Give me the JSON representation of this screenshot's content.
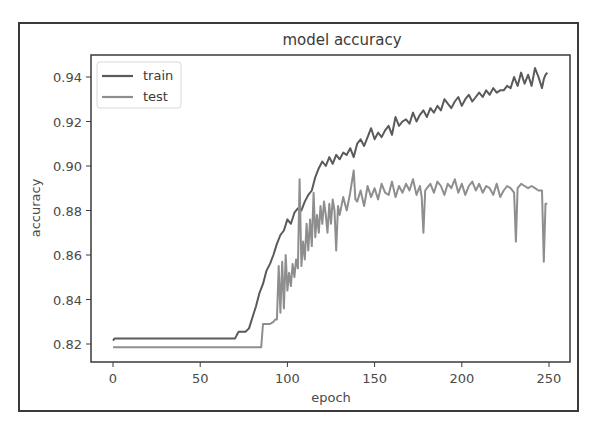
{
  "chart_data": {
    "type": "line",
    "title": "model accuracy",
    "xlabel": "epoch",
    "ylabel": "accuracy",
    "xlim": [
      -12,
      262
    ],
    "ylim": [
      0.8125,
      0.9485
    ],
    "xticks": [
      0,
      50,
      100,
      150,
      200,
      250
    ],
    "yticks": [
      0.82,
      0.84,
      0.86,
      0.88,
      0.9,
      0.92,
      0.94
    ],
    "ytick_labels": [
      "0.82",
      "0.84",
      "0.86",
      "0.88",
      "0.90",
      "0.92",
      "0.94"
    ],
    "grid": false,
    "legend": {
      "position": "upper left",
      "entries": [
        "train",
        "test"
      ]
    },
    "series": [
      {
        "name": "train",
        "color": "#5a5a5a",
        "x": [
          0,
          1,
          10,
          30,
          50,
          70,
          71,
          72,
          74,
          76,
          78,
          80,
          82,
          84,
          86,
          88,
          90,
          92,
          94,
          96,
          98,
          100,
          102,
          104,
          106,
          108,
          110,
          112,
          114,
          116,
          118,
          120,
          122,
          124,
          126,
          128,
          130,
          132,
          134,
          136,
          138,
          140,
          142,
          144,
          146,
          148,
          150,
          152,
          154,
          156,
          158,
          160,
          162,
          164,
          166,
          168,
          170,
          172,
          174,
          176,
          178,
          180,
          182,
          184,
          186,
          188,
          190,
          192,
          194,
          196,
          198,
          200,
          202,
          204,
          206,
          208,
          210,
          212,
          214,
          216,
          218,
          220,
          222,
          224,
          226,
          228,
          230,
          232,
          234,
          236,
          238,
          240,
          242,
          244,
          246,
          247,
          248,
          249
        ],
        "y": [
          0.8215,
          0.8225,
          0.8225,
          0.8225,
          0.8225,
          0.8225,
          0.824,
          0.8255,
          0.8255,
          0.8255,
          0.827,
          0.832,
          0.837,
          0.843,
          0.847,
          0.853,
          0.856,
          0.86,
          0.865,
          0.869,
          0.871,
          0.876,
          0.874,
          0.879,
          0.881,
          0.88,
          0.884,
          0.887,
          0.889,
          0.895,
          0.899,
          0.902,
          0.9,
          0.904,
          0.901,
          0.905,
          0.903,
          0.906,
          0.905,
          0.908,
          0.904,
          0.91,
          0.912,
          0.909,
          0.913,
          0.917,
          0.912,
          0.915,
          0.913,
          0.916,
          0.918,
          0.914,
          0.922,
          0.918,
          0.92,
          0.921,
          0.919,
          0.924,
          0.92,
          0.923,
          0.925,
          0.922,
          0.926,
          0.924,
          0.927,
          0.925,
          0.93,
          0.928,
          0.926,
          0.929,
          0.931,
          0.927,
          0.93,
          0.932,
          0.929,
          0.931,
          0.933,
          0.931,
          0.934,
          0.932,
          0.935,
          0.933,
          0.934,
          0.934,
          0.936,
          0.935,
          0.94,
          0.936,
          0.942,
          0.937,
          0.941,
          0.936,
          0.944,
          0.94,
          0.935,
          0.939,
          0.941,
          0.942
        ]
      },
      {
        "name": "test",
        "color": "#8e8e8e",
        "x": [
          0,
          10,
          30,
          50,
          70,
          85,
          86,
          88,
          90,
          92,
          93,
          94,
          95,
          96,
          97,
          98,
          99,
          100,
          101,
          102,
          103,
          104,
          105,
          106,
          107,
          108,
          109,
          110,
          111,
          112,
          113,
          114,
          115,
          116,
          117,
          118,
          119,
          120,
          121,
          122,
          123,
          124,
          125,
          126,
          127,
          128,
          129,
          130,
          132,
          134,
          136,
          138,
          139,
          140,
          142,
          144,
          146,
          148,
          150,
          152,
          154,
          156,
          158,
          160,
          162,
          164,
          166,
          168,
          170,
          172,
          174,
          176,
          177,
          178,
          179,
          180,
          182,
          184,
          186,
          188,
          190,
          192,
          194,
          196,
          198,
          200,
          202,
          204,
          206,
          208,
          210,
          212,
          214,
          216,
          218,
          220,
          222,
          224,
          226,
          228,
          230,
          231,
          232,
          233,
          234,
          236,
          238,
          240,
          242,
          244,
          246,
          247,
          248,
          249
        ],
        "y": [
          0.8185,
          0.8185,
          0.8185,
          0.8185,
          0.8185,
          0.8185,
          0.829,
          0.829,
          0.829,
          0.83,
          0.831,
          0.831,
          0.855,
          0.834,
          0.857,
          0.836,
          0.86,
          0.844,
          0.852,
          0.846,
          0.856,
          0.85,
          0.858,
          0.854,
          0.894,
          0.855,
          0.866,
          0.858,
          0.874,
          0.862,
          0.876,
          0.864,
          0.888,
          0.868,
          0.878,
          0.87,
          0.882,
          0.874,
          0.884,
          0.878,
          0.87,
          0.883,
          0.874,
          0.885,
          0.88,
          0.862,
          0.882,
          0.878,
          0.886,
          0.88,
          0.888,
          0.898,
          0.885,
          0.884,
          0.889,
          0.882,
          0.891,
          0.886,
          0.89,
          0.885,
          0.892,
          0.888,
          0.887,
          0.893,
          0.886,
          0.891,
          0.888,
          0.892,
          0.889,
          0.894,
          0.887,
          0.891,
          0.886,
          0.87,
          0.889,
          0.89,
          0.892,
          0.888,
          0.893,
          0.891,
          0.887,
          0.892,
          0.89,
          0.894,
          0.888,
          0.892,
          0.887,
          0.891,
          0.893,
          0.889,
          0.892,
          0.888,
          0.891,
          0.89,
          0.887,
          0.892,
          0.886,
          0.889,
          0.891,
          0.89,
          0.888,
          0.866,
          0.89,
          0.891,
          0.892,
          0.891,
          0.89,
          0.891,
          0.89,
          0.889,
          0.889,
          0.857,
          0.883,
          0.883
        ]
      }
    ]
  }
}
